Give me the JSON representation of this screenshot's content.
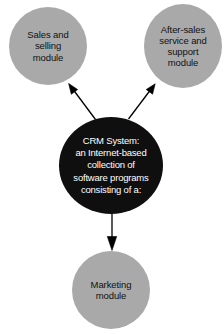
{
  "diagram": {
    "type": "hub-and-spoke",
    "background_color": "#ffffff",
    "hub": {
      "id": "crm-system",
      "label": "CRM System:\nan Internet-based\ncollection of\nsoftware programs\nconsisting of a:",
      "fill_color": "#100f0f",
      "text_color": "#ffffff",
      "shape": "circle"
    },
    "modules": [
      {
        "id": "sales-and-selling",
        "label": "Sales and\nselling\nmodule",
        "fill_color": "#a9a9a9",
        "text_color": "#111111",
        "shape": "circle",
        "position": "top-left"
      },
      {
        "id": "after-sales-service-and-support",
        "label": "After-sales\nservice and\nsupport\nmodule",
        "fill_color": "#a9a9a9",
        "text_color": "#111111",
        "shape": "circle",
        "position": "top-right"
      },
      {
        "id": "marketing",
        "label": "Marketing\nmodule",
        "fill_color": "#a9a9a9",
        "text_color": "#111111",
        "shape": "circle",
        "position": "bottom-center"
      }
    ],
    "connectors": [
      {
        "id": "crm-to-sales",
        "from": "crm-system",
        "to": "sales-and-selling",
        "style": "solid-line-filled-arrowhead",
        "color": "#000000"
      },
      {
        "id": "crm-to-after-sales",
        "from": "crm-system",
        "to": "after-sales-service-and-support",
        "style": "solid-line-filled-arrowhead",
        "color": "#000000"
      },
      {
        "id": "crm-to-marketing",
        "from": "crm-system",
        "to": "marketing",
        "style": "solid-line-filled-arrowhead",
        "color": "#000000"
      }
    ]
  }
}
